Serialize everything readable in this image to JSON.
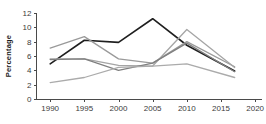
{
  "chart_data": {
    "type": "line",
    "title": "",
    "subtitle": "",
    "xlabel": "",
    "ylabel": "Percentage",
    "xlim": [
      1988,
      2021
    ],
    "ylim": [
      0,
      12
    ],
    "grid": false,
    "legend": "none",
    "x_ticks": [
      "1990",
      "1995",
      "2000",
      "2005",
      "2010",
      "2015",
      "2020"
    ],
    "x_tick_values": [
      1990,
      1995,
      2000,
      2005,
      2010,
      2015,
      2020
    ],
    "y_ticks": [
      "0",
      "2",
      "4",
      "6",
      "8",
      "10",
      "12"
    ],
    "y_tick_values": [
      0,
      2,
      4,
      6,
      8,
      10,
      12
    ],
    "series": [
      {
        "name": "series-dark",
        "color": "#1f1f1f",
        "width": 1.6,
        "x": [
          1990,
          1995,
          2000,
          2005,
          2010,
          2017
        ],
        "values": [
          4.9,
          8.2,
          7.9,
          11.2,
          7.5,
          3.9
        ]
      },
      {
        "name": "series-gray-upper",
        "color": "#9a9a9a",
        "width": 1.3,
        "x": [
          1990,
          1995,
          2000,
          2005,
          2010,
          2017
        ],
        "values": [
          7.1,
          8.7,
          5.6,
          5.0,
          8.0,
          4.5
        ]
      },
      {
        "name": "series-gray-peak-2010",
        "color": "#a5a5a5",
        "width": 1.3,
        "x": [
          1990,
          1995,
          2000,
          2005,
          2010,
          2017
        ],
        "values": [
          5.6,
          5.6,
          4.7,
          4.6,
          9.7,
          4.4
        ]
      },
      {
        "name": "series-gray-mid",
        "color": "#808080",
        "width": 1.3,
        "x": [
          1990,
          1995,
          2000,
          2005,
          2010,
          2017
        ],
        "values": [
          5.5,
          5.6,
          4.0,
          5.0,
          7.8,
          3.8
        ]
      },
      {
        "name": "series-gray-lower",
        "color": "#ababab",
        "width": 1.3,
        "x": [
          1990,
          1995,
          2000,
          2005,
          2010,
          2017
        ],
        "values": [
          2.3,
          3.0,
          4.4,
          4.6,
          4.9,
          3.0
        ]
      }
    ]
  },
  "axes": {
    "y_title": "Percentage"
  }
}
